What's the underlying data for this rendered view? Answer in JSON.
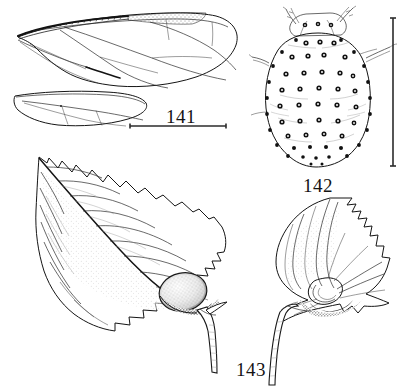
{
  "plate": {
    "title": "Taxonomic illustration plate, figures 141-143",
    "medium": "black-ink line drawing on white background",
    "width": 405,
    "height": 392,
    "ink_color": "#1a1a1a",
    "background_color": "#ffffff"
  },
  "figures": [
    {
      "id": "141",
      "label": "141",
      "subject": "insect wings",
      "description": "forewing with venation and stippled costal margin, hindwing below",
      "label_position": {
        "x": 166,
        "y": 106
      },
      "scale_bar": {
        "orientation": "horizontal",
        "x1": 130,
        "x2": 226,
        "y": 126
      },
      "parts": [
        "forewing",
        "hindwing",
        "pterostigma",
        "costal-margin",
        "wing-veins"
      ]
    },
    {
      "id": "142",
      "label": "142",
      "subject": "nymph, dorsal view",
      "description": "oval bodied nymph with rows of ringed dorsal pores, antennae and legs",
      "label_position": {
        "x": 303,
        "y": 175
      },
      "scale_bar": {
        "orientation": "vertical",
        "x": 393,
        "y1": 18,
        "y2": 166
      },
      "pore_rows": 10,
      "parts": [
        "body-outline",
        "antenna-left",
        "antenna-right",
        "leg-left",
        "leg-right",
        "dorsal-pores",
        "marginal-pores"
      ]
    },
    {
      "id": "143",
      "label": "143",
      "subject": "galled leaves",
      "description": "serrate leaf with basal gall swelling and a second rolled leaf gall",
      "label_position": {
        "x": 236,
        "y": 359
      },
      "parts": [
        "large-leaf",
        "leaf-gall",
        "petiole",
        "rolled-leaf",
        "midrib",
        "lateral-veins",
        "serrate-margin"
      ]
    }
  ],
  "icons": {
    "scale_bar_141": "horizontal-scale-bar-icon",
    "scale_bar_142": "vertical-scale-bar-icon"
  }
}
